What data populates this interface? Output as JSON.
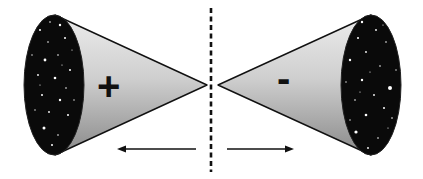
{
  "diagram": {
    "left_cone": {
      "sign": "+",
      "ellipse_fill": "#0a0a0a",
      "cone_fill_light": "#e6e6e6",
      "cone_fill_dark": "#8c8c8c",
      "direction": "left"
    },
    "right_cone": {
      "sign": "-",
      "ellipse_fill": "#0a0a0a",
      "cone_fill_light": "#e6e6e6",
      "cone_fill_dark": "#8c8c8c",
      "direction": "right"
    },
    "divider": {
      "style": "dashed",
      "color": "#111111"
    },
    "arrows": [
      {
        "direction": "left"
      },
      {
        "direction": "right"
      }
    ],
    "colors": {
      "background": "#ffffff",
      "stroke": "#111111",
      "star": "#ffffff"
    }
  }
}
